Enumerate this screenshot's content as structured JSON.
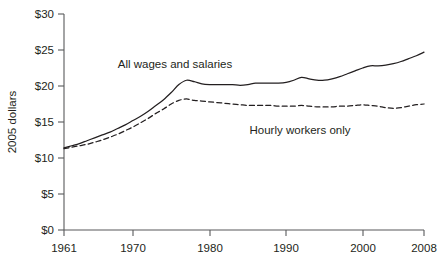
{
  "chart_data": {
    "type": "line",
    "title": "",
    "subtitle": "",
    "xlabel": "",
    "ylabel": "2005 dollars",
    "xlim": [
      1961,
      2008
    ],
    "ylim": [
      0,
      30
    ],
    "grid": false,
    "legend_position": "inline-annotation",
    "x_tick_labels": [
      "1961",
      "1970",
      "1980",
      "1990",
      "2000",
      "2008"
    ],
    "x_ticks": [
      1961,
      1970,
      1980,
      1990,
      2000,
      2008
    ],
    "y_tick_labels": [
      "$0",
      "$5",
      "$10",
      "$15",
      "$20",
      "$25",
      "$30"
    ],
    "y_ticks": [
      0,
      5,
      10,
      15,
      20,
      25,
      30
    ],
    "x": [
      1961,
      1962,
      1963,
      1964,
      1965,
      1966,
      1967,
      1968,
      1969,
      1970,
      1971,
      1972,
      1973,
      1974,
      1975,
      1976,
      1977,
      1978,
      1979,
      1980,
      1981,
      1982,
      1983,
      1984,
      1985,
      1986,
      1987,
      1988,
      1989,
      1990,
      1991,
      1992,
      1993,
      1994,
      1995,
      1996,
      1997,
      1998,
      1999,
      2000,
      2001,
      2002,
      2003,
      2004,
      2005,
      2006,
      2007,
      2008
    ],
    "series": [
      {
        "name": "All wages and salaries",
        "style": "solid",
        "values": [
          11.4,
          11.7,
          12.0,
          12.4,
          12.8,
          13.2,
          13.6,
          14.1,
          14.6,
          15.2,
          15.8,
          16.5,
          17.3,
          18.1,
          19.1,
          20.2,
          20.8,
          20.6,
          20.3,
          20.2,
          20.2,
          20.2,
          20.2,
          20.1,
          20.2,
          20.4,
          20.4,
          20.4,
          20.4,
          20.5,
          20.8,
          21.2,
          21.0,
          20.8,
          20.8,
          21.0,
          21.3,
          21.7,
          22.1,
          22.5,
          22.8,
          22.8,
          22.9,
          23.1,
          23.4,
          23.8,
          24.2,
          24.7
        ]
      },
      {
        "name": "Hourly workers only",
        "style": "dashed",
        "values": [
          11.3,
          11.5,
          11.7,
          11.9,
          12.2,
          12.5,
          12.9,
          13.3,
          13.8,
          14.3,
          14.9,
          15.5,
          16.2,
          16.8,
          17.5,
          18.0,
          18.2,
          18.0,
          17.9,
          17.8,
          17.7,
          17.6,
          17.5,
          17.4,
          17.3,
          17.3,
          17.3,
          17.3,
          17.2,
          17.2,
          17.2,
          17.3,
          17.2,
          17.1,
          17.1,
          17.1,
          17.2,
          17.2,
          17.3,
          17.4,
          17.3,
          17.2,
          17.0,
          16.9,
          17.0,
          17.2,
          17.4,
          17.5
        ]
      }
    ],
    "annotations": [
      {
        "text": "All wages and salaries",
        "x_px": 175,
        "y_px": 64
      },
      {
        "text": "Hourly workers only",
        "x_px": 300,
        "y_px": 130
      }
    ]
  }
}
